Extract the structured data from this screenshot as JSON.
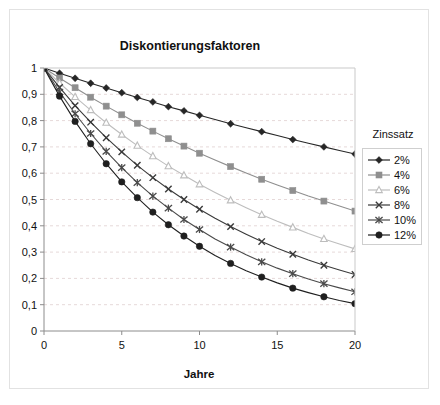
{
  "chart_data": {
    "type": "line",
    "title": "Diskontierungsfaktoren\nin Abhängigkeit der Laufzeit",
    "title_line1": "Diskontierungsfaktoren",
    "title_line2": "in Abhängigkeit der Laufzeit",
    "xlabel": "Jahre",
    "ylabel": "",
    "xlim": [
      0,
      20
    ],
    "ylim": [
      0,
      1
    ],
    "xticks": [
      0,
      5,
      10,
      15,
      20
    ],
    "xticklabels": [
      "0",
      "5",
      "10",
      "15",
      "20"
    ],
    "yticks": [
      0,
      0.1,
      0.2,
      0.3,
      0.4,
      0.5,
      0.6,
      0.7,
      0.8,
      0.9,
      1
    ],
    "yticklabels": [
      "0",
      "0,1",
      "0,2",
      "0,3",
      "0,4",
      "0,5",
      "0,6",
      "0,7",
      "0,8",
      "0,9",
      "1"
    ],
    "grid": "horizontal-dashed",
    "legend_position": "right",
    "legend_title": "Zinssatz",
    "x": [
      0,
      1,
      2,
      3,
      4,
      5,
      6,
      7,
      8,
      9,
      10,
      11,
      12,
      13,
      14,
      15,
      16,
      17,
      18,
      19,
      20
    ],
    "marker_x": [
      0,
      1,
      2,
      3,
      4,
      5,
      6,
      7,
      8,
      9,
      10,
      12,
      14,
      16,
      18,
      20
    ],
    "series": [
      {
        "name": "2%",
        "rate": 0.02,
        "color": "#262626",
        "marker": "diamond",
        "values": [
          1,
          0.98,
          0.961,
          0.942,
          0.924,
          0.906,
          0.888,
          0.871,
          0.853,
          0.837,
          0.82,
          0.804,
          0.788,
          0.773,
          0.758,
          0.743,
          0.728,
          0.714,
          0.7,
          0.686,
          0.673
        ]
      },
      {
        "name": "4%",
        "rate": 0.04,
        "color": "#8f8f8f",
        "marker": "square",
        "values": [
          1,
          0.962,
          0.925,
          0.889,
          0.855,
          0.822,
          0.79,
          0.76,
          0.731,
          0.703,
          0.676,
          0.65,
          0.625,
          0.601,
          0.577,
          0.555,
          0.534,
          0.513,
          0.494,
          0.475,
          0.456
        ]
      },
      {
        "name": "6%",
        "rate": 0.06,
        "color": "#bdbdbd",
        "marker": "triangle-open",
        "values": [
          1,
          0.943,
          0.89,
          0.84,
          0.792,
          0.747,
          0.705,
          0.665,
          0.627,
          0.592,
          0.558,
          0.527,
          0.497,
          0.469,
          0.442,
          0.417,
          0.394,
          0.371,
          0.35,
          0.331,
          0.312
        ]
      },
      {
        "name": "8%",
        "rate": 0.08,
        "color": "#3a3a3a",
        "marker": "x",
        "values": [
          1,
          0.926,
          0.857,
          0.794,
          0.735,
          0.681,
          0.63,
          0.583,
          0.54,
          0.5,
          0.463,
          0.429,
          0.397,
          0.368,
          0.34,
          0.315,
          0.292,
          0.27,
          0.25,
          0.232,
          0.215
        ]
      },
      {
        "name": "10%",
        "rate": 0.1,
        "color": "#4a4a4a",
        "marker": "asterisk",
        "values": [
          1,
          0.909,
          0.826,
          0.751,
          0.683,
          0.621,
          0.564,
          0.513,
          0.467,
          0.424,
          0.386,
          0.35,
          0.319,
          0.29,
          0.263,
          0.239,
          0.218,
          0.198,
          0.18,
          0.164,
          0.149
        ]
      },
      {
        "name": "12%",
        "rate": 0.12,
        "color": "#1f1f1f",
        "marker": "circle",
        "values": [
          1,
          0.893,
          0.797,
          0.712,
          0.636,
          0.567,
          0.507,
          0.452,
          0.404,
          0.361,
          0.322,
          0.287,
          0.257,
          0.229,
          0.205,
          0.183,
          0.163,
          0.146,
          0.13,
          0.116,
          0.104
        ]
      }
    ]
  },
  "legend": {
    "title": "Zinssatz",
    "items": [
      {
        "label": "2%"
      },
      {
        "label": "4%"
      },
      {
        "label": "6%"
      },
      {
        "label": "8%"
      },
      {
        "label": "10%"
      },
      {
        "label": "12%"
      }
    ]
  },
  "axes": {
    "x_title": "Jahre",
    "x_tick_labels": [
      "0",
      "5",
      "10",
      "15",
      "20"
    ],
    "y_tick_labels": [
      "1",
      "0,9",
      "0,8",
      "0,7",
      "0,6",
      "0,5",
      "0,4",
      "0,3",
      "0,2",
      "0,1",
      "0"
    ]
  },
  "colors": {
    "frame": "#8c8c8c",
    "outer_frame": "#e2e2e2",
    "grid": "#e6d9d9",
    "background": "#ffffff",
    "text": "#111111"
  }
}
